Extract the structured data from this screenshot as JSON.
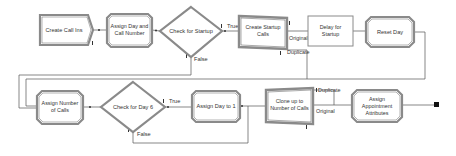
{
  "diagram": {
    "colors": {
      "border": "#7a7a7a",
      "border_dark": "#555555",
      "fill": "#ffffff",
      "line": "#555555",
      "end": "#111111"
    },
    "nodes": {
      "create_call_ins": {
        "label": "Create Call Ins",
        "type": "create"
      },
      "assign_day_call_number": {
        "line1": "Assign Day and",
        "line2": "Call Number",
        "type": "assign"
      },
      "check_startup": {
        "label": "Check for Startup",
        "type": "decide"
      },
      "create_startup_calls": {
        "line1": "Create Startup",
        "line2": "Calls",
        "type": "separate"
      },
      "delay_startup": {
        "line1": "Delay for",
        "line2": "Startup",
        "type": "process"
      },
      "reset_day": {
        "label": "Reset Day",
        "type": "assign"
      },
      "assign_number_calls": {
        "line1": "Assign Number",
        "line2": "of Calls",
        "type": "assign"
      },
      "check_day6": {
        "label": "Check for Day 6",
        "type": "decide"
      },
      "assign_day_1": {
        "label": "Assign Day to 1",
        "type": "assign"
      },
      "clone_calls": {
        "line1": "Clone up to",
        "line2": "Number of Calls",
        "type": "separate"
      },
      "assign_appt_attrs": {
        "line1": "Assign",
        "line2": "Appointment",
        "line3": "Attributes",
        "type": "assign"
      }
    },
    "edge_labels": {
      "startup_true": "True",
      "startup_false": "False",
      "startup_original": "Original",
      "startup_duplicate": "Duplicate",
      "day6_true": "True",
      "day6_false": "False",
      "clone_duplicate": "Duplicate",
      "clone_original": "Original"
    }
  }
}
